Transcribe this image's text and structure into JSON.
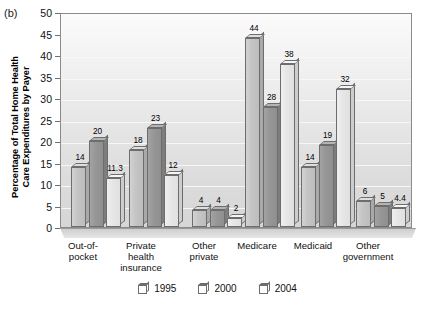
{
  "panel": {
    "label": "(b)"
  },
  "chart_data": {
    "type": "bar",
    "title": "",
    "subtitle": "",
    "xlabel": "",
    "ylabel": "Percentage of Total Home Health\nCare Expenditures by Payer",
    "ylabel_line1": "Percentage of Total Home Health",
    "ylabel_line2": "Care Expenditures by Payer",
    "ylim": [
      0,
      50
    ],
    "ytick_step": 5,
    "yticks": [
      0,
      5,
      10,
      15,
      20,
      25,
      30,
      35,
      40,
      45,
      50
    ],
    "grid": true,
    "grid_axis": "y",
    "legend_position": "bottom",
    "categories": [
      "Out-of-\npocket",
      "Private\nhealth\ninsurance",
      "Other\nprivate",
      "Medicare",
      "Medicaid",
      "Other\ngovernment"
    ],
    "series": [
      {
        "name": "1995",
        "color": "#c4c4c4",
        "values": [
          14,
          18,
          4,
          44,
          14,
          6
        ],
        "labels": [
          "14",
          "18",
          "4",
          "44",
          "14",
          "6"
        ]
      },
      {
        "name": "2000",
        "color": "#969696",
        "values": [
          20,
          23,
          4,
          28,
          19,
          5
        ],
        "labels": [
          "20",
          "23",
          "4",
          "28",
          "19",
          "5"
        ]
      },
      {
        "name": "2004",
        "color": "#e6e6e6",
        "values": [
          11.3,
          12,
          2,
          38,
          32,
          4.4
        ],
        "labels": [
          "11.3",
          "12",
          "2",
          "38",
          "32",
          "4.4"
        ]
      }
    ]
  },
  "legend": {
    "items": [
      {
        "label": "1995"
      },
      {
        "label": "2000"
      },
      {
        "label": "2004"
      }
    ]
  }
}
